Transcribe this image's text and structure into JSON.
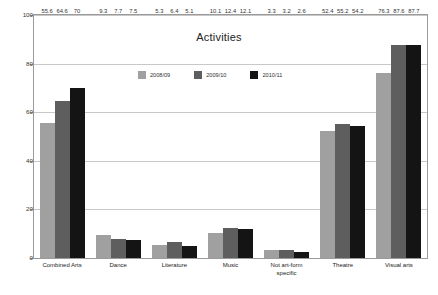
{
  "chart_data": {
    "type": "bar",
    "title": "Activities",
    "xlabel": "",
    "ylabel": "",
    "ylim": [
      0,
      100
    ],
    "yticks": [
      0,
      20,
      40,
      60,
      80,
      100
    ],
    "ytick_labels": [
      "0",
      "20",
      "40",
      "60",
      "80",
      "100"
    ],
    "grid": true,
    "legend_position": "inside-top-center",
    "categories": [
      "Combined Arts",
      "Dance",
      "Literature",
      "Music",
      "Not art-form\nspecific",
      "Theatre",
      "Visual arts"
    ],
    "series": [
      {
        "name": "2008/09",
        "color": "#a0a0a0",
        "values": [
          55.6,
          9.3,
          5.3,
          10.1,
          3.3,
          52.4,
          76.3
        ],
        "labels": [
          "55.6",
          "9.3",
          "5.3",
          "10.1",
          "3.3",
          "52.4",
          "76.3"
        ]
      },
      {
        "name": "2009/10",
        "color": "#5e5e5e",
        "values": [
          64.6,
          7.7,
          6.4,
          12.4,
          3.2,
          55.2,
          87.6
        ],
        "labels": [
          "64.6",
          "7.7",
          "6.4",
          "12.4",
          "3.2",
          "55.2",
          "87.6"
        ]
      },
      {
        "name": "2010/11",
        "color": "#141414",
        "values": [
          70,
          7.5,
          5.1,
          12.1,
          2.6,
          54.2,
          87.7
        ],
        "labels": [
          "70",
          "7.5",
          "5.1",
          "12.1",
          "2.6",
          "54.2",
          "87.7"
        ]
      }
    ]
  },
  "colors": {
    "background": "#ffffff",
    "plot_border": "#9a9a9a",
    "gridline": "#c8c8c8",
    "text": "#222222"
  }
}
